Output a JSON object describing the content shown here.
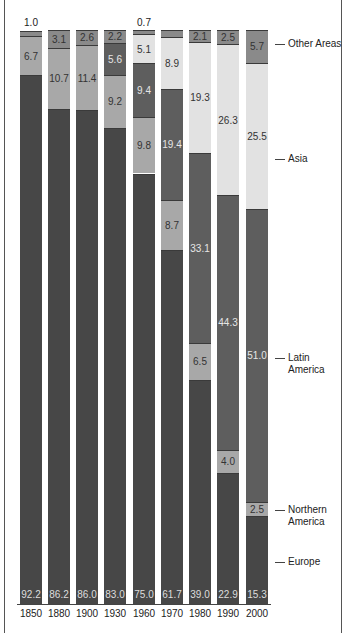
{
  "chart_data": {
    "type": "bar",
    "stacked": true,
    "title": "",
    "xlabel": "",
    "ylabel": "",
    "ylim": [
      0,
      100
    ],
    "grid": false,
    "legend_position": "right (inline labels)",
    "categories": [
      "1850",
      "1880",
      "1900",
      "1930",
      "1960",
      "1970",
      "1980",
      "1990",
      "2000"
    ],
    "series": [
      {
        "name": "Europe",
        "color": "#474747",
        "label_color": "#dddddd",
        "values": [
          92.2,
          86.2,
          86.0,
          83.0,
          75.0,
          61.7,
          39.0,
          22.9,
          15.3
        ]
      },
      {
        "name": "Northern America",
        "color": "#a8a8a8",
        "label_color": "#333333",
        "values": [
          6.7,
          10.7,
          11.4,
          9.2,
          9.8,
          8.7,
          6.5,
          4.0,
          2.5
        ]
      },
      {
        "name": "Latin America",
        "color": "#5e5e5e",
        "label_color": "#e6e6e6",
        "values": [
          0,
          0,
          0,
          5.6,
          9.4,
          19.4,
          33.1,
          44.3,
          51.0
        ]
      },
      {
        "name": "Asia",
        "color": "#e2e2e2",
        "label_color": "#333333",
        "values": [
          0,
          0,
          0,
          0,
          5.1,
          8.9,
          19.3,
          26.3,
          25.5
        ]
      },
      {
        "name": "Other Areas",
        "color": "#8a8a8a",
        "label_color": "#333333",
        "values": [
          1.0,
          3.1,
          2.6,
          2.2,
          0.7,
          1.3,
          2.1,
          2.5,
          5.7
        ]
      }
    ],
    "outside_labels": {
      "1850": "1.0",
      "1960": "0.7"
    },
    "legend_entries": [
      "Other Areas",
      "Asia",
      "Latin America",
      "Northern America",
      "Europe"
    ]
  },
  "legend": {
    "other": "Other Areas",
    "asia": "Asia",
    "latin_1": "Latin",
    "latin_2": "America",
    "northern_1": "Northern",
    "northern_2": "America",
    "europe": "Europe"
  }
}
